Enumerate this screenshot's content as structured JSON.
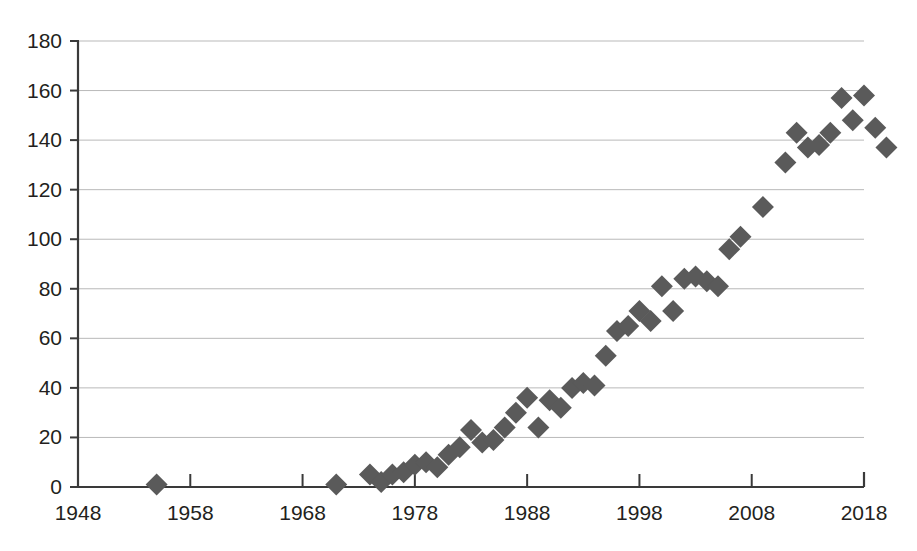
{
  "chart_data": {
    "type": "scatter",
    "title": "",
    "subtitle": "",
    "xlabel": "",
    "ylabel": "",
    "xlim": [
      1948,
      2018
    ],
    "ylim": [
      0,
      180
    ],
    "xticks": [
      1948,
      1958,
      1968,
      1978,
      1988,
      1998,
      2008,
      2018
    ],
    "yticks": [
      0,
      20,
      40,
      60,
      80,
      100,
      120,
      140,
      160,
      180
    ],
    "grid": "horizontal",
    "legend": "none",
    "marker": "diamond",
    "marker_color": "#5a5a5a",
    "marker_size": 11,
    "series": [
      {
        "name": "series-1",
        "points": [
          [
            1955,
            1
          ],
          [
            1971,
            1
          ],
          [
            1974,
            5
          ],
          [
            1975,
            2
          ],
          [
            1976,
            5
          ],
          [
            1977,
            6
          ],
          [
            1978,
            9
          ],
          [
            1979,
            10
          ],
          [
            1980,
            8
          ],
          [
            1981,
            13
          ],
          [
            1982,
            16
          ],
          [
            1983,
            23
          ],
          [
            1984,
            18
          ],
          [
            1985,
            19
          ],
          [
            1986,
            24
          ],
          [
            1987,
            30
          ],
          [
            1988,
            36
          ],
          [
            1989,
            24
          ],
          [
            1990,
            35
          ],
          [
            1991,
            32
          ],
          [
            1992,
            40
          ],
          [
            1993,
            42
          ],
          [
            1994,
            41
          ],
          [
            1995,
            53
          ],
          [
            1996,
            63
          ],
          [
            1997,
            65
          ],
          [
            1998,
            71
          ],
          [
            1999,
            67
          ],
          [
            2000,
            81
          ],
          [
            2001,
            71
          ],
          [
            2002,
            84
          ],
          [
            2003,
            85
          ],
          [
            2004,
            83
          ],
          [
            2005,
            81
          ],
          [
            2006,
            96
          ],
          [
            2007,
            101
          ],
          [
            2009,
            113
          ],
          [
            2011,
            131
          ],
          [
            2012,
            143
          ],
          [
            2013,
            137
          ],
          [
            2014,
            138
          ],
          [
            2015,
            143
          ],
          [
            2016,
            157
          ],
          [
            2017,
            148
          ],
          [
            2018,
            158
          ],
          [
            2019,
            145
          ],
          [
            2020,
            137
          ]
        ]
      }
    ]
  },
  "axes": {
    "y_tick_labels": [
      "180",
      "160",
      "140",
      "120",
      "100",
      "80",
      "60",
      "40",
      "20",
      "0"
    ],
    "x_tick_labels": [
      "1948",
      "1958",
      "1968",
      "1978",
      "1988",
      "1998",
      "2008",
      "2018"
    ]
  }
}
